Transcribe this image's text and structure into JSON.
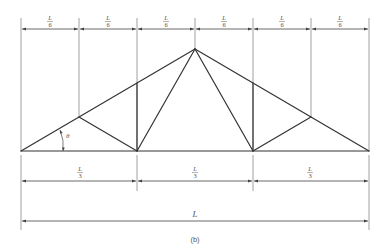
{
  "figure": {
    "caption": "(b)",
    "type": "truss",
    "colors": {
      "member": "#333333",
      "dimension": "#555555",
      "background": "#ffffff"
    }
  },
  "top_dimensions": [
    {
      "num": "L",
      "den": "6"
    },
    {
      "num": "L",
      "den": "6"
    },
    {
      "num": "L",
      "den": "6"
    },
    {
      "num": "L",
      "den": "6"
    },
    {
      "num": "L",
      "den": "6"
    },
    {
      "num": "L",
      "den": "6"
    }
  ],
  "bottom_dimensions": [
    {
      "num": "L",
      "den": "3"
    },
    {
      "num": "L",
      "den": "3"
    },
    {
      "num": "L",
      "den": "3"
    }
  ],
  "overall_dimension": {
    "label": "L"
  },
  "angle_label": "θ"
}
